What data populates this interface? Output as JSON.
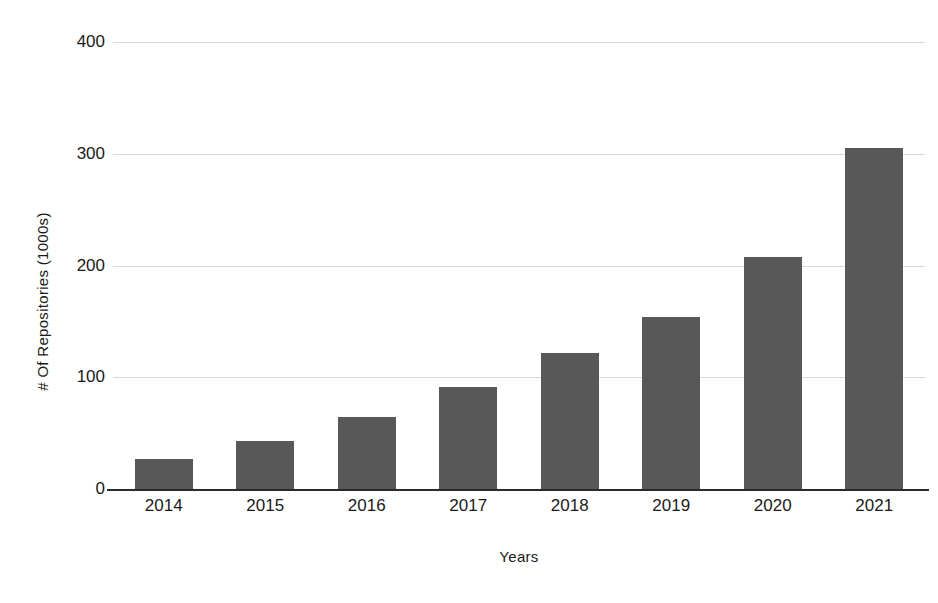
{
  "chart_data": {
    "type": "bar",
    "title": "",
    "xlabel": "Years",
    "ylabel": "# Of Repositories (1000s)",
    "categories": [
      "2014",
      "2015",
      "2016",
      "2017",
      "2018",
      "2019",
      "2020",
      "2021"
    ],
    "values": [
      27,
      43,
      64,
      91,
      122,
      154,
      208,
      305
    ],
    "series": [
      {
        "name": "# Of Repositories (1000s)",
        "values": [
          27,
          43,
          64,
          91,
          122,
          154,
          208,
          305
        ]
      }
    ],
    "ylim": [
      0,
      400
    ],
    "y_ticks": [
      0,
      100,
      200,
      300,
      400
    ],
    "y_tick_labels": [
      "0",
      "100",
      "200",
      "300",
      "400"
    ],
    "grid": true,
    "grid_axis": "y",
    "legend": false,
    "legend_position": "none",
    "bar_color": "#585858",
    "gridline_color": "#d8d8d8",
    "axis_color": "#2b2b2b",
    "background_color": "#ffffff"
  }
}
